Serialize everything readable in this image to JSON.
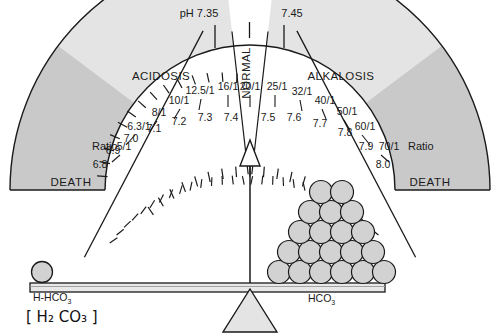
{
  "figure": {
    "title_top_left": "pH 7.35",
    "title_top_right": "7.45",
    "zones": {
      "acidosis": "ACIDOSIS",
      "normal": "NORMAL",
      "alkalosis": "ALKALOSIS",
      "death_left": "DEATH",
      "death_right": "DEATH"
    },
    "ratio_word_left": "Ratio",
    "ratio_word_right": "Ratio",
    "colors": {
      "dial_fill": "#e4e4e4",
      "death_fill": "#c9c9c9",
      "normal_fill": "#ffffff",
      "stroke": "#1a1a1a",
      "ball_fill": "#d2d2d2",
      "beam_fill": "#e8e8e8",
      "fulcrum_fill": "#e4e4e4"
    },
    "scale": {
      "ph_values": [
        "6.8",
        "6.9",
        "7.0",
        "7.1",
        "7.2",
        "7.3",
        "7.4",
        "7.5",
        "7.6",
        "7.7",
        "7.8",
        "7.9",
        "8.0"
      ],
      "ratio_values": [
        "5/1",
        "6.3/1",
        "8/1",
        "10/1",
        "12.5/1",
        "16/1",
        "20/1",
        "25/1",
        "32/1",
        "40/1",
        "50/1",
        "60/1",
        "70/1"
      ],
      "pairs": [
        {
          "ph": "6.8",
          "ratio": "5/1"
        },
        {
          "ph": "6.9",
          "ratio": "6.3/1"
        },
        {
          "ph": "7.0",
          "ratio": "8/1"
        },
        {
          "ph": "7.1",
          "ratio": "10/1"
        },
        {
          "ph": "7.2",
          "ratio": "12.5/1"
        },
        {
          "ph": "7.3",
          "ratio": "16/1"
        },
        {
          "ph": "7.4",
          "ratio": "20/1"
        },
        {
          "ph": "7.5",
          "ratio": "25/1"
        },
        {
          "ph": "7.6",
          "ratio": "32/1"
        },
        {
          "ph": "7.7",
          "ratio": "40/1"
        },
        {
          "ph": "7.8",
          "ratio": "50/1"
        },
        {
          "ph": "7.9",
          "ratio": "60/1"
        },
        {
          "ph": "8.0",
          "ratio": "70/1"
        }
      ]
    },
    "balance": {
      "left_pan_label": "H-HCO",
      "left_pan_sub": "3",
      "left_pan_annotation": "[ H₂ CO₃ ]",
      "right_pan_label": "HCO",
      "right_pan_sub": "3",
      "left_ball_count": 1,
      "right_ball_rows": [
        6,
        5,
        4,
        3,
        2
      ],
      "right_ball_count": 20
    },
    "needle": {
      "points_to_ph": "7.4",
      "points_to_ratio": "20/1"
    }
  }
}
